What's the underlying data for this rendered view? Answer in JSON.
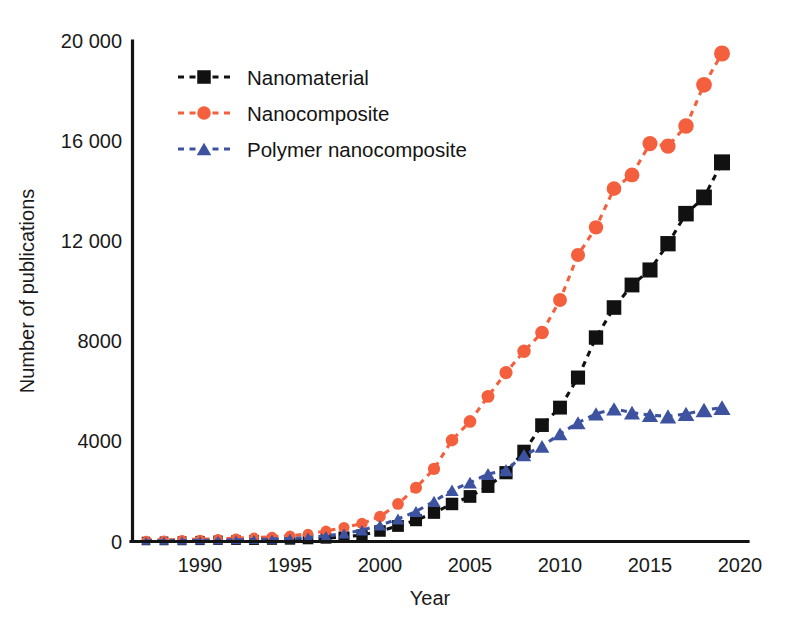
{
  "chart_data": {
    "type": "line",
    "title": "",
    "xlabel": "Year",
    "ylabel": "Number of publications",
    "xlim": [
      1986,
      2020
    ],
    "ylim": [
      0,
      20000
    ],
    "grid": false,
    "legend_position": "upper-left-inside",
    "x": [
      1987,
      1988,
      1989,
      1990,
      1991,
      1992,
      1993,
      1994,
      1995,
      1996,
      1997,
      1998,
      1999,
      2000,
      2001,
      2002,
      2003,
      2004,
      2005,
      2006,
      2007,
      2008,
      2009,
      2010,
      2011,
      2012,
      2013,
      2014,
      2015,
      2016,
      2017,
      2018,
      2019
    ],
    "xticks": [
      1990,
      1995,
      2000,
      2005,
      2010,
      2015,
      2020
    ],
    "xtick_labels": [
      "1990",
      "1995",
      "2000",
      "2005",
      "2010",
      "2015",
      "2020"
    ],
    "yticks": [
      0,
      4000,
      8000,
      12000,
      16000,
      20000
    ],
    "ytick_labels": [
      "0",
      "4000",
      "8000",
      "12 000",
      "16 000",
      "20 000"
    ],
    "series": [
      {
        "name": "Nanomaterial",
        "color": "#111111",
        "marker": "square",
        "linestyle": "dashed",
        "values": [
          20,
          25,
          30,
          40,
          50,
          55,
          60,
          70,
          80,
          100,
          130,
          180,
          260,
          420,
          620,
          850,
          1150,
          1500,
          1800,
          2200,
          2750,
          3600,
          4650,
          5350,
          6550,
          8150,
          9350,
          10250,
          10850,
          11900,
          13100,
          13750,
          15150
        ]
      },
      {
        "name": "Nanocomposite",
        "color": "#F4603E",
        "marker": "circle",
        "linestyle": "dashed",
        "values": [
          60,
          70,
          80,
          90,
          110,
          130,
          160,
          190,
          230,
          300,
          420,
          560,
          720,
          1000,
          1500,
          2150,
          2900,
          4050,
          4800,
          5800,
          6750,
          7600,
          8350,
          9650,
          11450,
          12550,
          14100,
          14650,
          15900,
          15800,
          16600,
          18250,
          19500
        ]
      },
      {
        "name": "Polymer nanocomposite",
        "color": "#3E53A0",
        "marker": "triangle",
        "linestyle": "dashed",
        "values": [
          25,
          30,
          35,
          45,
          55,
          65,
          80,
          95,
          120,
          160,
          220,
          320,
          450,
          650,
          900,
          1200,
          1600,
          2050,
          2350,
          2700,
          2850,
          3450,
          3800,
          4300,
          4750,
          5100,
          5300,
          5150,
          5050,
          5000,
          5100,
          5250,
          5350
        ]
      }
    ]
  },
  "legend": {
    "items": [
      {
        "label": "Nanomaterial",
        "color": "#111111",
        "marker": "square"
      },
      {
        "label": "Nanocomposite",
        "color": "#F4603E",
        "marker": "circle"
      },
      {
        "label": "Polymer nanocomposite",
        "color": "#3E53A0",
        "marker": "triangle"
      }
    ]
  },
  "colors": {
    "axis": "#141414",
    "text": "#1a1a1a",
    "background": "#ffffff",
    "nanomaterial": "#111111",
    "nanocomposite": "#F4603E",
    "polymer_nanocomposite": "#3E53A0"
  }
}
